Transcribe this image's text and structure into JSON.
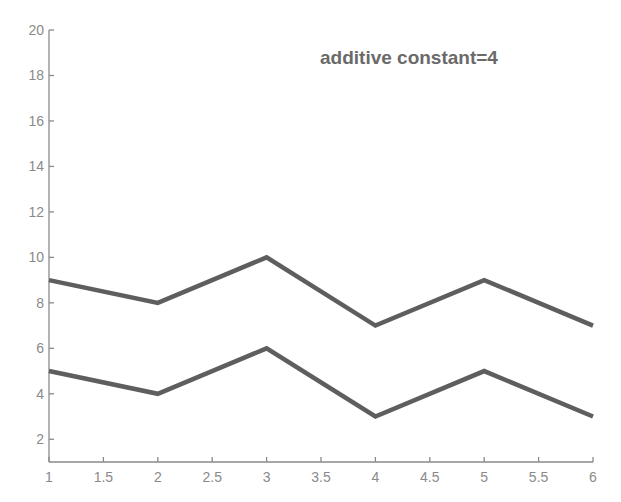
{
  "chart_data": {
    "type": "line",
    "title": "",
    "annotation": "additive constant=4",
    "xlabel": "",
    "ylabel": "",
    "x": [
      1,
      2,
      3,
      4,
      5,
      6
    ],
    "series": [
      {
        "name": "upper",
        "values": [
          9,
          8,
          10,
          7,
          9,
          7
        ]
      },
      {
        "name": "lower",
        "values": [
          5,
          4,
          6,
          3,
          5,
          3
        ]
      }
    ],
    "xlim": [
      1,
      6
    ],
    "ylim": [
      1,
      20
    ],
    "xticks": [
      "1",
      "1.5",
      "2",
      "2.5",
      "3",
      "3.5",
      "4",
      "4.5",
      "5",
      "5.5",
      "6"
    ],
    "yticks": [
      "2",
      "4",
      "6",
      "8",
      "10",
      "12",
      "14",
      "16",
      "18",
      "20"
    ],
    "grid": false,
    "legend": "none",
    "colors": {
      "line": "#5e5e5e",
      "axis": "#8a8a8a",
      "text": "#8a8a8a",
      "annotation": "#6a6a6a"
    }
  }
}
